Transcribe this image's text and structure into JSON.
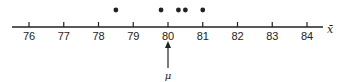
{
  "chart_data": {
    "type": "scatter",
    "title": "",
    "xlabel": "x̄",
    "ylabel": "",
    "xlim": [
      75.5,
      84.5
    ],
    "ticks": [
      76,
      77,
      78,
      79,
      80,
      81,
      82,
      83,
      84
    ],
    "tick_labels": [
      "76",
      "77",
      "78",
      "79",
      "80",
      "81",
      "82",
      "83",
      "84"
    ],
    "points": [
      78.5,
      79.8,
      80.3,
      80.5,
      81.0
    ],
    "grid": false,
    "annotations": [
      {
        "type": "arrow",
        "x": 80,
        "label": "μ",
        "direction": "up"
      }
    ]
  },
  "colors": {
    "ink": "#222222",
    "background": "#ffffff"
  }
}
